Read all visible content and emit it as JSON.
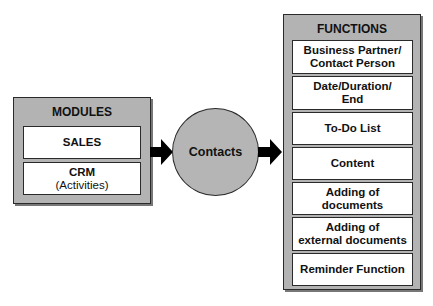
{
  "modules": {
    "title": "MODULES",
    "items": [
      {
        "label": "SALES",
        "sub": ""
      },
      {
        "label": "CRM",
        "sub": "(Activities)"
      }
    ]
  },
  "center": {
    "label": "Contacts"
  },
  "functions": {
    "title": "FUNCTIONS",
    "items": [
      {
        "line1": "Business Partner/",
        "line2": "Contact Person"
      },
      {
        "line1": "Date/Duration/",
        "line2": "End"
      },
      {
        "line1": "To-Do List",
        "line2": ""
      },
      {
        "line1": "Content",
        "line2": ""
      },
      {
        "line1": "Adding of",
        "line2": "documents"
      },
      {
        "line1": "Adding of",
        "line2": "external documents"
      },
      {
        "line1": "Reminder Function",
        "line2": ""
      }
    ]
  },
  "colors": {
    "panel": "#b3b3b3",
    "box": "#ffffff",
    "border": "#2a2a2a",
    "arrow": "#000000"
  }
}
